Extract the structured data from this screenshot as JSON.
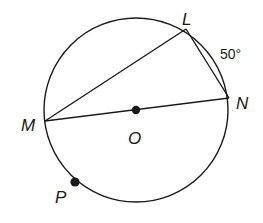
{
  "diagram": {
    "type": "circle-geometry",
    "circle": {
      "center_label": "O",
      "cx": 136,
      "cy": 110,
      "r": 92
    },
    "points": {
      "L": {
        "label": "L",
        "x": 186,
        "y": 29
      },
      "N": {
        "label": "N",
        "x": 229,
        "y": 98
      },
      "M": {
        "label": "M",
        "x": 45,
        "y": 121
      },
      "O": {
        "label": "O",
        "x": 136,
        "y": 110
      },
      "P": {
        "label": "P",
        "x": 75,
        "y": 182
      }
    },
    "segments": [
      {
        "from": "M",
        "to": "L",
        "name": "chord-ML"
      },
      {
        "from": "L",
        "to": "N",
        "name": "chord-LN"
      },
      {
        "from": "M",
        "to": "N",
        "name": "diameter-MN"
      }
    ],
    "arc_annotation": {
      "arc": "LN",
      "label": "50°"
    },
    "stroke_color": "#1a1a1a"
  }
}
